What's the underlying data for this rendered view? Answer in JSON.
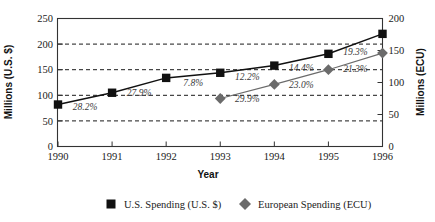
{
  "chart_data": {
    "type": "line",
    "title": "",
    "xlabel": "Year",
    "ylabel": "Millions (U.S. $)",
    "y2label": "Millions (ECU)",
    "categories": [
      "1990",
      "1991",
      "1992",
      "1993",
      "1994",
      "1995",
      "1996"
    ],
    "x": [
      1990,
      1991,
      1992,
      1993,
      1994,
      1995,
      1996
    ],
    "ylim": [
      0,
      250
    ],
    "yticks": [
      0,
      50,
      100,
      150,
      200,
      250
    ],
    "y2lim": [
      0,
      200
    ],
    "y2ticks": [
      0,
      50,
      100,
      150,
      200
    ],
    "grid": true,
    "gridlines_at": [
      50,
      100,
      150,
      200
    ],
    "legend_position": "bottom",
    "series": [
      {
        "name": "U.S. Spending (U.S. $)",
        "axis": "left",
        "marker": "square",
        "color": "#111111",
        "values": [
          82,
          105,
          134,
          144,
          158,
          181,
          220
        ],
        "labels": [
          "",
          "28.2%",
          "27.9%",
          "7.8%",
          "12.2%",
          "14.4%",
          "19.3%"
        ]
      },
      {
        "name": "European Spending (ECU)",
        "axis": "right",
        "marker": "diamond",
        "color": "#6b6b6b",
        "values": [
          null,
          null,
          null,
          75,
          97,
          120,
          146
        ],
        "labels": [
          "",
          "",
          "",
          "",
          "29.9%",
          "23.0%",
          "21.3%"
        ]
      }
    ]
  },
  "axes": {
    "left": {
      "title": "Millions (U.S. $)",
      "ticks": [
        "250",
        "200",
        "150",
        "100",
        "50",
        "0"
      ]
    },
    "right": {
      "title": "Millions (ECU)",
      "ticks": [
        "200",
        "150",
        "100",
        "50",
        "0"
      ]
    },
    "bottom": {
      "title": "Year",
      "ticks": [
        "1990",
        "1991",
        "1992",
        "1993",
        "1994",
        "1995",
        "1996"
      ]
    }
  },
  "annotations": {
    "us": [
      "28.2%",
      "27.9%",
      "7.8%",
      "12.2%",
      "14.4%",
      "19.3%"
    ],
    "eu": [
      "29.9%",
      "23.0%",
      "21.3%"
    ]
  },
  "legend": {
    "items": [
      {
        "label": "U.S. Spending (U.S. $)",
        "marker": "square",
        "color": "#111111"
      },
      {
        "label": "European Spending (ECU)",
        "marker": "diamond",
        "color": "#6b6b6b"
      }
    ]
  }
}
